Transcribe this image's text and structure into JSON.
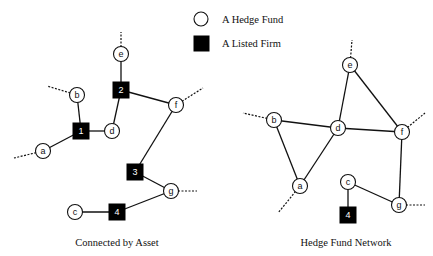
{
  "legend": {
    "items": [
      {
        "shape": "circle",
        "label": "A Hedge Fund"
      },
      {
        "shape": "square",
        "label": "A Listed Firm"
      }
    ]
  },
  "left_graph": {
    "caption": "Connected by Asset",
    "nodes": [
      {
        "id": "e",
        "type": "fund",
        "x": 121,
        "y": 54
      },
      {
        "id": "2",
        "type": "firm",
        "x": 121,
        "y": 90
      },
      {
        "id": "b",
        "type": "fund",
        "x": 77,
        "y": 95
      },
      {
        "id": "f",
        "type": "fund",
        "x": 176,
        "y": 105
      },
      {
        "id": "1",
        "type": "firm",
        "x": 81,
        "y": 131
      },
      {
        "id": "d",
        "type": "fund",
        "x": 112,
        "y": 131
      },
      {
        "id": "a",
        "type": "fund",
        "x": 43,
        "y": 151
      },
      {
        "id": "3",
        "type": "firm",
        "x": 135,
        "y": 172
      },
      {
        "id": "g",
        "type": "fund",
        "x": 171,
        "y": 191
      },
      {
        "id": "c",
        "type": "fund",
        "x": 75,
        "y": 212
      },
      {
        "id": "4",
        "type": "firm",
        "x": 117,
        "y": 212
      }
    ],
    "edges": [
      [
        "e",
        "2"
      ],
      [
        "2",
        "f"
      ],
      [
        "2",
        "d"
      ],
      [
        "b",
        "1"
      ],
      [
        "1",
        "d"
      ],
      [
        "1",
        "a"
      ],
      [
        "f",
        "3"
      ],
      [
        "3",
        "g"
      ],
      [
        "g",
        "4"
      ],
      [
        "4",
        "c"
      ]
    ],
    "dangling": [
      {
        "from": "e",
        "to": [
          121,
          32
        ]
      },
      {
        "from": "b",
        "to": [
          47,
          86
        ]
      },
      {
        "from": "a",
        "to": [
          14,
          158
        ]
      },
      {
        "from": "f",
        "to": [
          203,
          88
        ]
      },
      {
        "from": "g",
        "to": [
          197,
          191
        ]
      }
    ]
  },
  "right_graph": {
    "caption": "Hedge Fund Network",
    "nodes": [
      {
        "id": "e",
        "type": "fund",
        "x": 350,
        "y": 65
      },
      {
        "id": "b",
        "type": "fund",
        "x": 274,
        "y": 120
      },
      {
        "id": "d",
        "type": "fund",
        "x": 338,
        "y": 128
      },
      {
        "id": "f",
        "type": "fund",
        "x": 402,
        "y": 132
      },
      {
        "id": "a",
        "type": "fund",
        "x": 300,
        "y": 186
      },
      {
        "id": "c",
        "type": "fund",
        "x": 348,
        "y": 182
      },
      {
        "id": "g",
        "type": "fund",
        "x": 399,
        "y": 205
      },
      {
        "id": "4",
        "type": "firm",
        "x": 348,
        "y": 215
      }
    ],
    "edges": [
      [
        "e",
        "d"
      ],
      [
        "e",
        "f"
      ],
      [
        "b",
        "d"
      ],
      [
        "d",
        "f"
      ],
      [
        "b",
        "a"
      ],
      [
        "a",
        "d"
      ],
      [
        "f",
        "g"
      ],
      [
        "c",
        "g"
      ],
      [
        "c",
        "4"
      ]
    ],
    "dangling": [
      {
        "from": "e",
        "to": [
          352,
          40
        ]
      },
      {
        "from": "b",
        "to": [
          243,
          113
        ]
      },
      {
        "from": "f",
        "to": [
          425,
          113
        ]
      },
      {
        "from": "a",
        "to": [
          278,
          213
        ]
      },
      {
        "from": "g",
        "to": [
          425,
          205
        ]
      }
    ]
  }
}
